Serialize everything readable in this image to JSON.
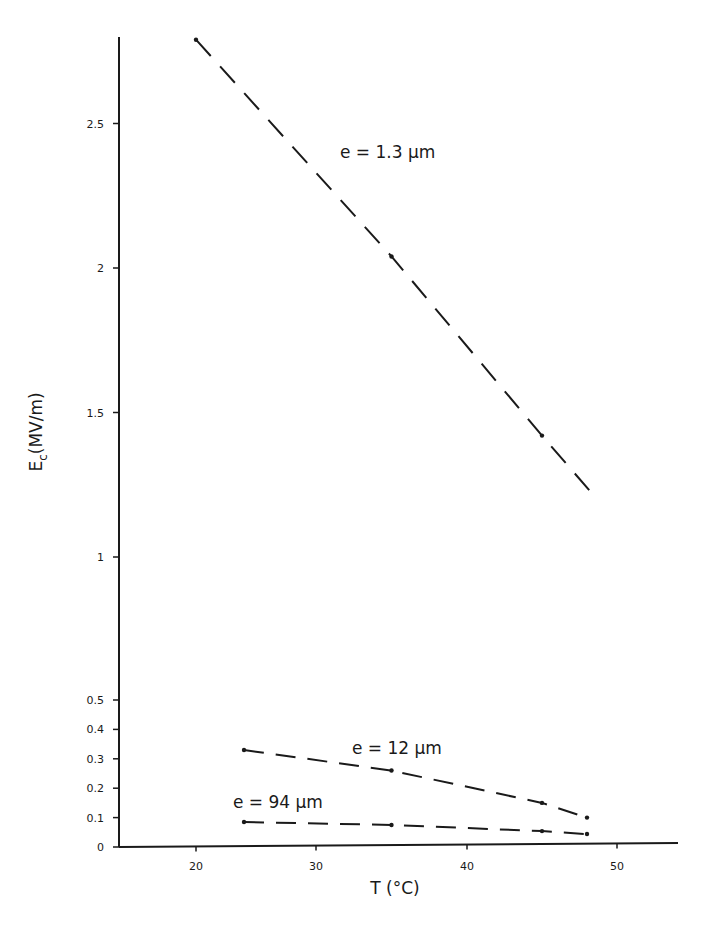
{
  "chart_data": {
    "type": "line",
    "title": "",
    "xlabel": "T (°C)",
    "ylabel": "E_c (MV/m)",
    "x_ticks": [
      20,
      30,
      40,
      50
    ],
    "y_ticks_lower": [
      0,
      0.1,
      0.2,
      0.3,
      0.4,
      0.5
    ],
    "y_ticks_upper": [
      1,
      1.5,
      2,
      2.5
    ],
    "y_tick_labels": {
      "0": "0",
      "0.1": "0.1",
      "0.2": "0.2",
      "0.3": "0.3",
      "0.4": "0.4",
      "0.5": "0.5",
      "1": "1",
      "1.5": "1.5",
      "2": "2",
      "2.5": "2.5"
    },
    "y_axis_break": [
      0.5,
      1
    ],
    "xlim": [
      15,
      54
    ],
    "ylim": [
      0,
      2.9
    ],
    "grid": false,
    "legend": "inline labels",
    "series": [
      {
        "name": "e = 1.3 µm",
        "label_mu": "e = 1.3 µm",
        "style": "dashed",
        "points": [
          [
            20,
            2.79
          ],
          [
            35,
            2.04
          ],
          [
            45,
            1.42
          ]
        ],
        "line_end": [
          48.5,
          1.21
        ],
        "label_pos": {
          "x": 340,
          "y": 158
        }
      },
      {
        "name": "e = 12 µm",
        "style": "dash-dot",
        "points": [
          [
            24,
            0.33
          ],
          [
            35,
            0.26
          ],
          [
            45,
            0.15
          ],
          [
            48,
            0.1
          ]
        ],
        "line_end": null,
        "label_pos": {
          "x": 352,
          "y": 754
        }
      },
      {
        "name": "e = 94 µm",
        "style": "dash-dot",
        "points": [
          [
            24,
            0.085
          ],
          [
            35,
            0.075
          ],
          [
            45,
            0.054
          ],
          [
            48,
            0.044
          ]
        ],
        "line_end": null,
        "label_pos": {
          "x": 233,
          "y": 808
        }
      }
    ]
  },
  "axes": {
    "x_title": "T (°C)",
    "y_title_main": "E",
    "y_title_sub": "c",
    "y_title_unit": "(MV/m)"
  },
  "colors": {
    "ink": "#1a1a1a",
    "background": "#ffffff"
  }
}
